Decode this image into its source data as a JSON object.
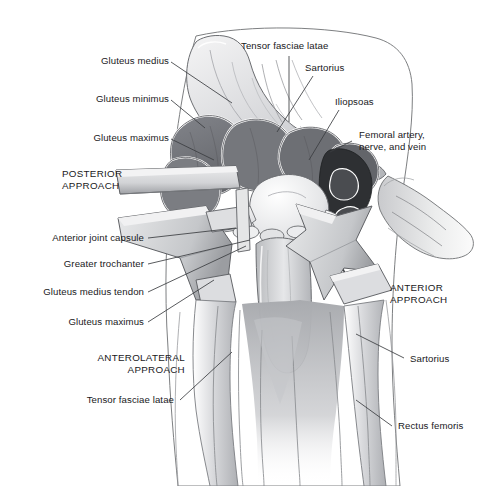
{
  "figure": {
    "type": "anatomical-illustration",
    "region": "hip",
    "style": "grayscale line and tone drawing",
    "background_color": "#ffffff",
    "ink_color": "#19191c",
    "palette": {
      "muscle_dark": "#6f7175",
      "muscle_mid": "#97999d",
      "muscle_light": "#c3c5c8",
      "bone_light": "#e3e4e6",
      "retractor": "#d5d6d9",
      "retractor_shadow": "#a9abaf",
      "vessel_dark": "#2e3033",
      "outline": "#4a4c50",
      "highlight": "#ffffff"
    }
  },
  "labels": {
    "gluteus_medius": "Gluteus medius",
    "gluteus_minimus": "Gluteus minimus",
    "gluteus_maximus_upper": "Gluteus maximus",
    "tensor_fasciae_latae_top": "Tensor fasciae latae",
    "sartorius_top": "Sartorius",
    "iliopsoas": "Iliopsoas",
    "femoral_bundle": "Femoral artery,\nnerve, and vein",
    "anterior_joint_capsule": "Anterior joint capsule",
    "greater_trochanter": "Greater trochanter",
    "gluteus_medius_tendon": "Gluteus medius tendon",
    "gluteus_maximus_lower": "Gluteus maximus",
    "tensor_fasciae_latae_bottom": "Tensor fasciae latae",
    "sartorius_lower": "Sartorius",
    "rectus_femoris": "Rectus femoris"
  },
  "approaches": {
    "posterior": "POSTERIOR\nAPPROACH",
    "anterolateral": "ANTEROLATERAL\nAPPROACH",
    "anterior": "ANTERIOR\nAPPROACH"
  }
}
